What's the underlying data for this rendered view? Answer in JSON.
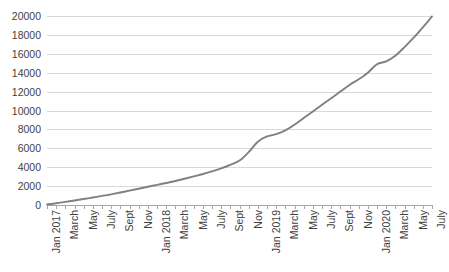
{
  "chart_data": {
    "type": "line",
    "title": "",
    "subtitle": "",
    "xlabel": "",
    "ylabel": "",
    "ylim": [
      0,
      20000
    ],
    "ytick_step": 2000,
    "yticks": [
      0,
      2000,
      4000,
      6000,
      8000,
      10000,
      12000,
      14000,
      16000,
      18000,
      20000
    ],
    "ytick_labels": [
      "0",
      "2000",
      "4000",
      "6000",
      "8000",
      "10000",
      "12000",
      "14000",
      "16000",
      "18000",
      "20000"
    ],
    "grid": true,
    "grid_axis": "y",
    "legend": false,
    "legend_position": "none",
    "line_color": "#808080",
    "grid_color": "#d9d9d9",
    "axis_color": "#a6a6a6",
    "text_color": "#3f3f3f",
    "xtick_label_rotation": -90,
    "x": [
      "Jan 2017",
      "Feb 2017",
      "March",
      "April",
      "May",
      "June",
      "July",
      "Aug",
      "Sept",
      "Oct",
      "Nov",
      "Dec",
      "Jan 2018",
      "Feb 2018",
      "March",
      "April",
      "May",
      "June",
      "July",
      "Aug",
      "Sept",
      "Oct",
      "Nov",
      "Dec",
      "Jan 2019",
      "Feb 2019",
      "March",
      "April",
      "May",
      "June",
      "July",
      "Aug",
      "Sept",
      "Oct",
      "Nov",
      "Dec",
      "Jan 2020",
      "Feb 2020",
      "March",
      "April",
      "May",
      "June",
      "July"
    ],
    "xtick_labels_visible": [
      "Jan 2017",
      "March",
      "May",
      "July",
      "Sept",
      "Nov",
      "Jan 2018",
      "March",
      "May",
      "July",
      "Sept",
      "Nov",
      "Jan 2019",
      "March",
      "May",
      "July",
      "Sept",
      "Nov",
      "Jan 2020",
      "March",
      "May",
      "July"
    ],
    "categories": [
      "Jan 2017",
      "Feb 2017",
      "March",
      "April",
      "May",
      "June",
      "July",
      "Aug",
      "Sept",
      "Oct",
      "Nov",
      "Dec",
      "Jan 2018",
      "Feb 2018",
      "March",
      "April",
      "May",
      "June",
      "July",
      "Aug",
      "Sept",
      "Oct",
      "Nov",
      "Dec",
      "Jan 2019",
      "Feb 2019",
      "March",
      "April",
      "May",
      "June",
      "July",
      "Aug",
      "Sept",
      "Oct",
      "Nov",
      "Dec",
      "Jan 2020",
      "Feb 2020",
      "March",
      "April",
      "May",
      "June",
      "July"
    ],
    "values": [
      60,
      180,
      330,
      480,
      630,
      790,
      960,
      1130,
      1320,
      1520,
      1720,
      1930,
      2130,
      2330,
      2540,
      2780,
      3030,
      3280,
      3560,
      3880,
      4250,
      4700,
      5600,
      6700,
      7250,
      7500,
      7900,
      8500,
      9200,
      9900,
      10600,
      11300,
      12000,
      12700,
      13300,
      14000,
      14900,
      15200,
      15800,
      16700,
      17700,
      18800,
      19950
    ],
    "series": [
      {
        "name": "Cumulative total",
        "color": "#808080",
        "values": [
          60,
          180,
          330,
          480,
          630,
          790,
          960,
          1130,
          1320,
          1520,
          1720,
          1930,
          2130,
          2330,
          2540,
          2780,
          3030,
          3280,
          3560,
          3880,
          4250,
          4700,
          5600,
          6700,
          7250,
          7500,
          7900,
          8500,
          9200,
          9900,
          10600,
          11300,
          12000,
          12700,
          13300,
          14000,
          14900,
          15200,
          15800,
          16700,
          17700,
          18800,
          19950
        ]
      }
    ],
    "annotations": []
  }
}
